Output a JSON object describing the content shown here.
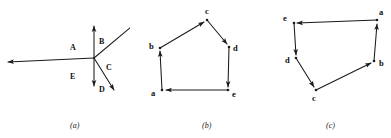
{
  "figure": {
    "background_color": "#ffffff",
    "ink_color": "#1a1a1a",
    "panels": [
      {
        "id": "a",
        "caption": "(a)",
        "kind": "vector-ray-diagram",
        "description": "Five rays radiating from a common origin point, each labeled with a capital letter",
        "origin": {
          "x": 94,
          "y": 58
        },
        "rays": [
          {
            "label": "A",
            "direction": "left",
            "tip": {
              "x": 6,
              "y": 62
            },
            "label_pos": {
              "x": 72,
              "y": 47
            },
            "arrowhead": true
          },
          {
            "label": "B",
            "direction": "up",
            "tip": {
              "x": 94,
              "y": 24
            },
            "label_pos": {
              "x": 99,
              "y": 41
            },
            "arrowhead": true
          },
          {
            "label": "C",
            "direction": "up-right",
            "tip": {
              "x": 132,
              "y": 26
            },
            "label_pos": {
              "x": 106,
              "y": 67
            },
            "arrowhead": false
          },
          {
            "label": "C2",
            "direction": "down-right",
            "tip": {
              "x": 116,
              "y": 92
            },
            "label_pos": null,
            "arrowhead": true
          },
          {
            "label": "D",
            "direction": "down",
            "tip": {
              "x": 94,
              "y": 88
            },
            "label_pos": {
              "x": 99,
              "y": 89
            },
            "arrowhead": true
          },
          {
            "label": "E",
            "direction": "none",
            "tip": null,
            "label_pos": {
              "x": 72,
              "y": 76
            },
            "arrowhead": false
          }
        ],
        "labels": [
          "A",
          "B",
          "C",
          "D",
          "E"
        ]
      },
      {
        "id": "b",
        "caption": "(b)",
        "kind": "directed-polygon",
        "description": "Closed pentagon traversed counter-clockwise with arrowheads at each vertex",
        "vertices": [
          {
            "name": "a",
            "x": 32,
            "y": 90,
            "label_pos": {
              "x": 23,
              "y": 95
            }
          },
          {
            "name": "b",
            "x": 30,
            "y": 48,
            "label_pos": {
              "x": 19,
              "y": 49
            }
          },
          {
            "name": "c",
            "x": 77,
            "y": 20,
            "label_pos": {
              "x": 76,
              "y": 13
            }
          },
          {
            "name": "d",
            "x": 99,
            "y": 47,
            "label_pos": {
              "x": 104,
              "y": 50
            }
          },
          {
            "name": "e",
            "x": 98,
            "y": 90,
            "label_pos": {
              "x": 103,
              "y": 95
            }
          }
        ],
        "edges": [
          {
            "from": "a",
            "to": "b"
          },
          {
            "from": "b",
            "to": "c"
          },
          {
            "from": "c",
            "to": "d"
          },
          {
            "from": "d",
            "to": "e"
          },
          {
            "from": "e",
            "to": "a"
          }
        ]
      },
      {
        "id": "c",
        "caption": "(c)",
        "kind": "directed-polygon",
        "description": "Closed pentagon traversed clockwise with arrowheads at each vertex",
        "vertices": [
          {
            "name": "e",
            "x": 34,
            "y": 23,
            "label_pos": {
              "x": 25,
              "y": 20
            }
          },
          {
            "name": "a",
            "x": 117,
            "y": 20,
            "label_pos": {
              "x": 120,
              "y": 15
            }
          },
          {
            "name": "b",
            "x": 114,
            "y": 61,
            "label_pos": {
              "x": 119,
              "y": 64
            }
          },
          {
            "name": "c",
            "x": 56,
            "y": 90,
            "label_pos": {
              "x": 52,
              "y": 99
            }
          },
          {
            "name": "d",
            "x": 36,
            "y": 58,
            "label_pos": {
              "x": 26,
              "y": 61
            }
          }
        ],
        "edges": [
          {
            "from": "a",
            "to": "e"
          },
          {
            "from": "e",
            "to": "d"
          },
          {
            "from": "d",
            "to": "c"
          },
          {
            "from": "c",
            "to": "b"
          },
          {
            "from": "b",
            "to": "a"
          }
        ]
      }
    ],
    "caption_y": 126,
    "caption_positions": {
      "a": 78,
      "b": 205,
      "c": 325
    }
  }
}
